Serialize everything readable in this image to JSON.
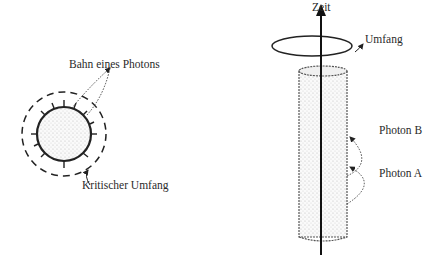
{
  "left_panel": {
    "labels": {
      "photon_path": "Bahn eines Photons",
      "critical_circumference": "Kritischer Umfang"
    }
  },
  "right_panel": {
    "labels": {
      "time_axis": "Zeit",
      "circumference": "Umfang",
      "photon_b": "Photon B",
      "photon_a": "Photon A"
    }
  },
  "colors": {
    "ink": "#222222",
    "stipple": "#bdbdbd",
    "background": "#ffffff"
  }
}
